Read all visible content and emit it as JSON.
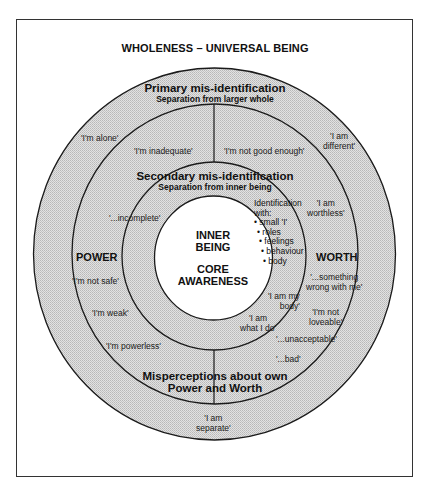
{
  "title": "WHOLENESS – UNIVERSAL BEING",
  "rings": {
    "primary": {
      "heading": "Primary mis-identification",
      "subheading": "Separation from larger whole"
    },
    "secondary": {
      "heading": "Secondary mis-identification",
      "subheading": "Separation from inner being"
    },
    "misperceptions": {
      "heading_line1": "Misperceptions about own",
      "heading_line2": "Power and Worth"
    }
  },
  "core": {
    "line1": "INNER",
    "line2": "BEING",
    "line3": "CORE",
    "line4": "AWARENESS"
  },
  "sides": {
    "power": "POWER",
    "worth": "WORTH"
  },
  "identification": {
    "heading1": "Identification",
    "heading2": "with:",
    "items": [
      "• small 'I'",
      "• roles",
      "• feelings",
      "• behaviour",
      "• body"
    ]
  },
  "beliefs": {
    "alone": "'I'm alone'",
    "different_1": "'I am",
    "different_2": "different'",
    "inadequate": "'I'm inadequate'",
    "not_good_enough": "'I'm not good enough'",
    "worthless_1": "'I am",
    "worthless_2": "worthless'",
    "incomplete": "'...incomplete'",
    "not_safe": "'I'm not safe'",
    "weak": "'I'm weak'",
    "powerless": "'I'm powerless'",
    "something_wrong_1": "'...something",
    "something_wrong_2": "wrong with me'",
    "not_loveable_1": "'I'm not",
    "not_loveable_2": "loveable'",
    "my_body_1": "'I am my",
    "my_body_2": "body'",
    "what_i_do_1": "'I am",
    "what_i_do_2": "what I do'",
    "unacceptable": "'...unacceptable'",
    "bad": "'...bad'",
    "separate_1": "'I am",
    "separate_2": "separate'"
  },
  "colors": {
    "ring_fill": "#d2d2d2",
    "core_fill": "#ffffff",
    "line": "#1a1a1a"
  }
}
